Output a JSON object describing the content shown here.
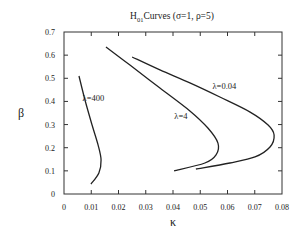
{
  "chart_data": {
    "type": "line",
    "title_main": "H",
    "title_sub": "01",
    "title_rest": "Curves (σ=1, ρ=5)",
    "xlabel": "κ",
    "ylabel": "β",
    "xlim": [
      0,
      0.08
    ],
    "ylim": [
      0,
      0.7
    ],
    "xticks": [
      "0",
      "0.01",
      "0.02",
      "0.03",
      "0.04",
      "0.05",
      "0.06",
      "0.07",
      "0.08"
    ],
    "xtick_values": [
      0,
      0.01,
      0.02,
      0.03,
      0.04,
      0.05,
      0.06,
      0.07,
      0.08
    ],
    "yticks": [
      "0",
      "0.1",
      "0.2",
      "0.3",
      "0.4",
      "0.5",
      "0.6",
      "0.7"
    ],
    "ytick_values": [
      0,
      0.1,
      0.2,
      0.3,
      0.4,
      0.5,
      0.6,
      0.7
    ],
    "grid": false,
    "series": [
      {
        "name": "λ=400",
        "label_at": [
          0.0068,
          0.4
        ],
        "points": [
          [
            0.0055,
            0.51
          ],
          [
            0.0077,
            0.406
          ],
          [
            0.0103,
            0.298
          ],
          [
            0.0125,
            0.212
          ],
          [
            0.0136,
            0.147
          ],
          [
            0.0128,
            0.091
          ],
          [
            0.0099,
            0.043
          ]
        ]
      },
      {
        "name": "λ=4",
        "label_at": [
          0.0405,
          0.325
        ],
        "points": [
          [
            0.0154,
            0.635
          ],
          [
            0.0242,
            0.557
          ],
          [
            0.0352,
            0.458
          ],
          [
            0.0462,
            0.359
          ],
          [
            0.0528,
            0.285
          ],
          [
            0.0565,
            0.22
          ],
          [
            0.0558,
            0.169
          ],
          [
            0.0517,
            0.134
          ],
          [
            0.0404,
            0.1
          ]
        ]
      },
      {
        "name": "λ=0.04",
        "label_at": [
          0.0545,
          0.455
        ],
        "points": [
          [
            0.025,
            0.592
          ],
          [
            0.0352,
            0.536
          ],
          [
            0.0462,
            0.48
          ],
          [
            0.0572,
            0.419
          ],
          [
            0.0683,
            0.354
          ],
          [
            0.0749,
            0.298
          ],
          [
            0.0771,
            0.255
          ],
          [
            0.0756,
            0.203
          ],
          [
            0.0701,
            0.16
          ],
          [
            0.0609,
            0.134
          ],
          [
            0.0484,
            0.108
          ]
        ]
      }
    ]
  }
}
